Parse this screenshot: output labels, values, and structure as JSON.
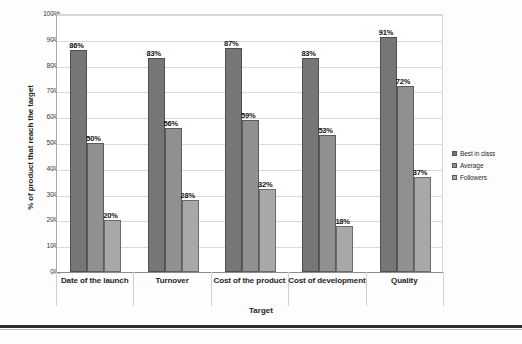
{
  "chart_data": {
    "type": "bar",
    "title": "",
    "xlabel": "Target",
    "ylabel": "% of product that reach the target",
    "categories": [
      "Date of the launch",
      "Turnover",
      "Cost of the product",
      "Cost of development",
      "Quality"
    ],
    "series": [
      {
        "name": "Best in class",
        "color": "#767676",
        "values": [
          86,
          83,
          87,
          83,
          91
        ]
      },
      {
        "name": "Average",
        "color": "#909090",
        "values": [
          50,
          56,
          59,
          53,
          72
        ]
      },
      {
        "name": "Followers",
        "color": "#a8a8a8",
        "values": [
          20,
          28,
          32,
          18,
          37
        ]
      }
    ],
    "value_labels": [
      [
        "86%",
        "83%",
        "87%",
        "83%",
        "91%"
      ],
      [
        "50%",
        "56%",
        "59%",
        "53%",
        "72%"
      ],
      [
        "20%",
        "28%",
        "32%",
        "18%",
        "37%"
      ]
    ],
    "ylim": [
      0,
      100
    ],
    "ytick_labels": [
      "100%",
      "90%",
      "80%",
      "70%",
      "60%",
      "50%",
      "40%",
      "30%",
      "20%",
      "10%",
      "0%"
    ],
    "ytick_values": [
      100,
      90,
      80,
      70,
      60,
      50,
      40,
      30,
      20,
      10,
      0
    ],
    "grid": true,
    "legend_position": "right"
  },
  "legend": {
    "entries": [
      "Best in class",
      "Average",
      "Followers"
    ]
  }
}
